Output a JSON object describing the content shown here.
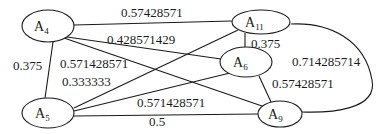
{
  "diagram": {
    "type": "weighted-graph",
    "nodes": [
      {
        "id": "A4",
        "base": "A",
        "sub": "4",
        "cx": 48,
        "cy": 26,
        "rx": 26,
        "ry": 16
      },
      {
        "id": "A11",
        "base": "A",
        "sub": "11",
        "cx": 261,
        "cy": 22,
        "rx": 29,
        "ry": 12
      },
      {
        "id": "A6",
        "base": "A",
        "sub": "6",
        "cx": 246,
        "cy": 62,
        "rx": 26,
        "ry": 15
      },
      {
        "id": "A5",
        "base": "A",
        "sub": "5",
        "cx": 48,
        "cy": 113,
        "rx": 26,
        "ry": 15
      },
      {
        "id": "A9",
        "base": "A",
        "sub": "9",
        "cx": 280,
        "cy": 114,
        "rx": 22,
        "ry": 13
      }
    ],
    "edges": [
      {
        "from": "A4",
        "to": "A11",
        "weight": "0.57428571",
        "lx": 121,
        "ly": 17
      },
      {
        "from": "A4",
        "to": "A6",
        "weight": "0.428571429",
        "lx": 107,
        "ly": 44
      },
      {
        "from": "A4",
        "to": "A9",
        "weight": "0.571428571",
        "lx": 60,
        "ly": 68
      },
      {
        "from": "A4",
        "to": "A5",
        "weight": "0.375",
        "lx": 14,
        "ly": 70
      },
      {
        "from": "A5",
        "to": "A11",
        "weight": "0.333333",
        "lx": 62,
        "ly": 85
      },
      {
        "from": "A5",
        "to": "A6",
        "weight": "0.571428571",
        "lx": 137,
        "ly": 107
      },
      {
        "from": "A5",
        "to": "A9",
        "weight": "0.5",
        "lx": 148,
        "ly": 125
      },
      {
        "from": "A11",
        "to": "A6",
        "weight": "0.375",
        "lx": 251,
        "ly": 48
      },
      {
        "from": "A6",
        "to": "A9",
        "weight": "0.57428571",
        "lx": 272,
        "ly": 88
      },
      {
        "from": "A11",
        "to": "A9",
        "weight": "0.714285714",
        "lx": 292,
        "ly": 66
      }
    ]
  }
}
